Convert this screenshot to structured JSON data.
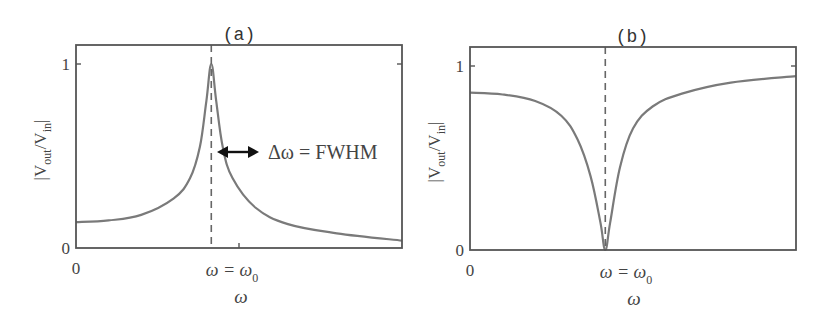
{
  "chart_data": [
    {
      "type": "line",
      "panel_label": "(a)",
      "title": "(a)",
      "xlabel": "ω",
      "ylabel": "|V_out/V_in|",
      "ylabel_parts": {
        "bar_left": "|V",
        "sub1": "out",
        "slash": "/V",
        "sub2": "in",
        "bar_right": "|"
      },
      "x_ticks": [
        {
          "pos": 0,
          "label": "0"
        },
        {
          "pos": 0.415,
          "label": "ω = ω₀",
          "main": "ω = ω",
          "sub": "0"
        }
      ],
      "y_ticks": [
        {
          "pos": 0,
          "label": "0"
        },
        {
          "pos": 1,
          "label": "1"
        }
      ],
      "ylim": [
        0,
        1.1
      ],
      "xlim": [
        0,
        1
      ],
      "grid": false,
      "description": "Lorentzian resonance peak (band-pass)",
      "series": [
        {
          "name": "response",
          "color": "#7a7a7a",
          "x": [
            0.0,
            0.1,
            0.2,
            0.3,
            0.35,
            0.38,
            0.4,
            0.415,
            0.43,
            0.45,
            0.48,
            0.55,
            0.65,
            0.8,
            1.0
          ],
          "values": [
            0.14,
            0.15,
            0.18,
            0.27,
            0.38,
            0.55,
            0.8,
            1.0,
            0.8,
            0.55,
            0.38,
            0.22,
            0.13,
            0.08,
            0.04
          ]
        }
      ],
      "annotations": [
        {
          "type": "vline",
          "x": 0.415,
          "style": "dashed"
        },
        {
          "type": "double-arrow",
          "y": 0.5,
          "x_from": 0.365,
          "x_to": 0.465,
          "label": "Δω = FWHM"
        }
      ]
    },
    {
      "type": "line",
      "panel_label": "(b)",
      "title": "(b)",
      "xlabel": "ω",
      "ylabel": "|V_out/V_in|",
      "ylabel_parts": {
        "bar_left": "|V",
        "sub1": "out",
        "slash": "/V",
        "sub2": "in",
        "bar_right": "|"
      },
      "x_ticks": [
        {
          "pos": 0,
          "label": "0"
        },
        {
          "pos": 0.415,
          "label": "ω = ω₀",
          "main": "ω = ω",
          "sub": "0"
        }
      ],
      "y_ticks": [
        {
          "pos": 0,
          "label": "0"
        },
        {
          "pos": 1,
          "label": "1"
        }
      ],
      "ylim": [
        0,
        1.1
      ],
      "xlim": [
        0,
        1
      ],
      "grid": false,
      "description": "Notch (band-stop) response with zero at ω₀",
      "series": [
        {
          "name": "response",
          "color": "#7a7a7a",
          "x": [
            0.0,
            0.1,
            0.2,
            0.28,
            0.33,
            0.37,
            0.4,
            0.415,
            0.43,
            0.46,
            0.5,
            0.56,
            0.65,
            0.8,
            1.0
          ],
          "values": [
            0.855,
            0.845,
            0.81,
            0.73,
            0.6,
            0.4,
            0.15,
            0.0,
            0.15,
            0.45,
            0.66,
            0.78,
            0.85,
            0.91,
            0.945
          ]
        }
      ],
      "annotations": [
        {
          "type": "vline",
          "x": 0.415,
          "style": "dashed"
        }
      ]
    }
  ],
  "colors": {
    "axes": "#555555",
    "curve": "#7a7a7a",
    "dashed": "#666666",
    "arrow": "#111111",
    "text": "#444444"
  }
}
